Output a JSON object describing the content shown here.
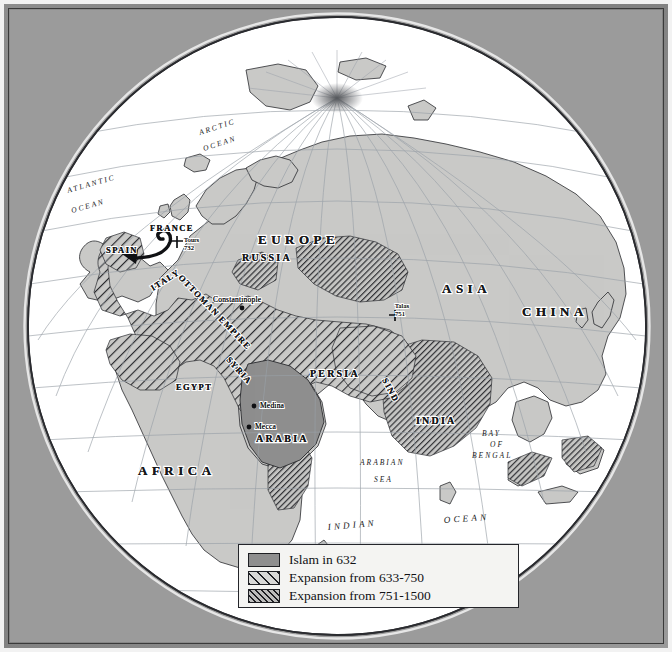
{
  "map": {
    "projection": "orthographic globe",
    "ocean_color": "#ffffff",
    "land_color": "#c9c9c7",
    "islam_632_color": "#8e8e8e",
    "graticule_color": "#9aa0a8",
    "frame_color": "#8d8d8d"
  },
  "continents": [
    {
      "name": "EUROPE",
      "x": 248,
      "y": 234
    },
    {
      "name": "ASIA",
      "x": 432,
      "y": 283
    },
    {
      "name": "AFRICA",
      "x": 166,
      "y": 465
    },
    {
      "name": "CHINA",
      "x": 541,
      "y": 306
    },
    {
      "name": "ARABIA",
      "x": 277,
      "y": 432
    },
    {
      "name": "INDIA",
      "x": 432,
      "y": 414
    }
  ],
  "regions": [
    {
      "name": "RUSSIA",
      "x": 262,
      "y": 248
    },
    {
      "name": "PERSIA",
      "x": 330,
      "y": 364
    },
    {
      "name": "FRANCE",
      "x": 163,
      "y": 219
    },
    {
      "name": "SPAIN",
      "x": 118,
      "y": 240
    },
    {
      "name": "ITALY",
      "x": 152,
      "y": 279
    },
    {
      "name": "EGYPT",
      "x": 186,
      "y": 377
    },
    {
      "name": "SYRIA",
      "x": 231,
      "y": 355
    },
    {
      "name": "SIND",
      "x": 385,
      "y": 385
    },
    {
      "name": "OTTOMAN EMPIRE",
      "x": 196,
      "y": 296
    }
  ],
  "cities": [
    {
      "name": "Constantinople",
      "x": 238,
      "y": 295
    },
    {
      "name": "Medina",
      "x": 250,
      "y": 395
    },
    {
      "name": "Mecca",
      "x": 245,
      "y": 416
    }
  ],
  "battles": [
    {
      "name": "Tours",
      "year": "732",
      "x": 172,
      "y": 231
    },
    {
      "name": "Talas",
      "year": "751",
      "x": 390,
      "y": 299
    }
  ],
  "oceans": [
    {
      "name": "ARCTIC",
      "x": 204,
      "y": 125
    },
    {
      "name": "OCEAN",
      "x": 206,
      "y": 139
    },
    {
      "name": "ATLANTIC",
      "x": 76,
      "y": 183
    },
    {
      "name": "OCEAN",
      "x": 79,
      "y": 201
    },
    {
      "name": "ARABIAN",
      "x": 380,
      "y": 455
    },
    {
      "name": "SEA",
      "x": 388,
      "y": 471
    },
    {
      "name": "BAY",
      "x": 487,
      "y": 425
    },
    {
      "name": "OF",
      "x": 489,
      "y": 436
    },
    {
      "name": "BENGAL",
      "x": 487,
      "y": 447
    },
    {
      "name": "INDIAN",
      "x": 352,
      "y": 518
    },
    {
      "name": "OCEAN",
      "x": 460,
      "y": 514
    }
  ],
  "legend": {
    "items": [
      {
        "label": "Islam in 632",
        "swatch": "solid-gray"
      },
      {
        "label": "Expansion from 633-750",
        "swatch": "wide-diagonal-hatch"
      },
      {
        "label": "Expansion from 751-1500",
        "swatch": "tight-diagonal-hatch"
      }
    ]
  }
}
